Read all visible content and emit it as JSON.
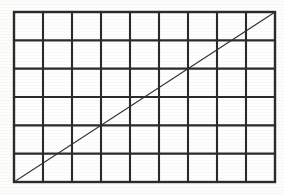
{
  "figure": {
    "name": "grid-with-diagonal",
    "background_color": "#fdfdfc",
    "cell_fill_color": "#ffffff",
    "grid_line_color": "#2b2b2b",
    "diagonal_line_color": "#2f2f2f",
    "grid_line_width": 2.1,
    "outer_border_width": 2.4,
    "diagonal_line_width": 1.15
  },
  "grid": {
    "columns": 9,
    "rows": 6,
    "left": 14,
    "top": 12,
    "right": 275,
    "bottom": 182,
    "width": 261,
    "height": 170,
    "cell_width": 29,
    "cell_height": 28.333,
    "x_positions": [
      14,
      43,
      72,
      101,
      130,
      159,
      188,
      217,
      246,
      275
    ],
    "y_positions": [
      12,
      40.333,
      68.667,
      97,
      125.333,
      153.667,
      182
    ]
  },
  "diagonal": {
    "x1": 14,
    "y1": 182,
    "x2": 275,
    "y2": 12,
    "start_corner": "bottom-left",
    "end_corner": "top-right",
    "slope": -0.6513,
    "rise": 170,
    "run": 261
  },
  "canvas": {
    "width": 284,
    "height": 194
  }
}
